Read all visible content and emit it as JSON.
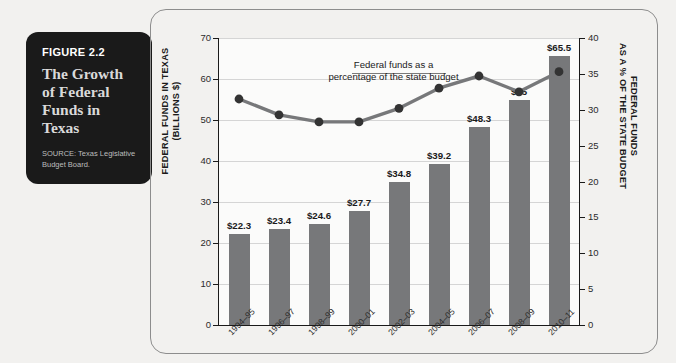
{
  "caption": {
    "figure_number": "FIGURE 2.2",
    "title": "The Growth of Federal Funds in Texas",
    "source": "SOURCE: Texas Legislative Budget Board."
  },
  "chart_data": {
    "type": "bar",
    "title": "The Growth of Federal Funds in Texas",
    "categories": [
      "1994–95",
      "1996–97",
      "1998–99",
      "2000–01",
      "2002–03",
      "2004–05",
      "2006–07",
      "2008–09",
      "2010–11"
    ],
    "series": [
      {
        "name": "Federal funds in Texas (billions $)",
        "type": "bar",
        "axis": "left",
        "values": [
          22.3,
          23.4,
          24.6,
          27.7,
          34.8,
          39.2,
          48.3,
          55,
          65.5
        ],
        "labels": [
          "$22.3",
          "$23.4",
          "$24.6",
          "$27.7",
          "$34.8",
          "$39.2",
          "$48.3",
          "$55",
          "$65.5"
        ],
        "color": "#77787a"
      },
      {
        "name": "Federal funds as a percentage of the state budget",
        "type": "line",
        "axis": "right",
        "values": [
          31.5,
          29.3,
          28.3,
          28.3,
          30.2,
          33.0,
          34.7,
          32.5,
          35.3
        ],
        "color": "#77787a"
      }
    ],
    "xlabel": "",
    "ylabel": "FEDERAL FUNDS IN TEXAS (BILLIONS $)",
    "ylabel_right": "FEDERAL FUNDS AS A % OF THE STATE BUDGET",
    "ylim": [
      0,
      70
    ],
    "ylim_right": [
      0,
      40
    ],
    "yticks": [
      0,
      10,
      20,
      30,
      40,
      50,
      60,
      70
    ],
    "yticks_right": [
      0,
      5,
      10,
      15,
      20,
      25,
      30,
      35,
      40
    ],
    "grid": true,
    "legend": "none",
    "annotations": [
      {
        "text": "Federal funds as a percentage of the state budget"
      }
    ]
  },
  "axes": {
    "left_title_line1": "FEDERAL FUNDS IN TEXAS",
    "left_title_line2": "(BILLIONS $)",
    "right_title_line1": "FEDERAL FUNDS",
    "right_title_line2": "AS A % OF THE STATE BUDGET"
  },
  "annotation": {
    "line1": "Federal funds as a",
    "line2": "percentage of the state budget"
  },
  "colors": {
    "page_background": "#f2f1ef",
    "caption_background": "#1a1a1a",
    "bar": "#77787a",
    "line": "#77787a",
    "axis": "#1a1a1a",
    "grid": "#d5d5d5",
    "frame": "#8d8d8d"
  }
}
